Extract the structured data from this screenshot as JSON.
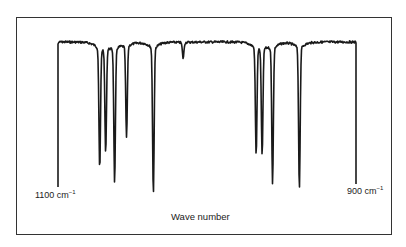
{
  "chart_data": {
    "type": "line",
    "title": "",
    "xlabel": "Wave number",
    "ylabel": "",
    "x_tick_labels": [
      {
        "value": 1100,
        "label": "1100 cm",
        "unit_exp": "-1"
      },
      {
        "value": 900,
        "label": "900 cm",
        "unit_exp": "-1"
      }
    ],
    "xlim": [
      1100,
      900
    ],
    "ylim": [
      0,
      100
    ],
    "grid": false,
    "legend": null,
    "series": [
      {
        "name": "IR transmittance spectrum",
        "baseline_transmittance": 95,
        "absorption_bands": [
          {
            "wavenumber": 1100,
            "transmittance": 0
          },
          {
            "wavenumber": 1072,
            "transmittance": 17
          },
          {
            "wavenumber": 1068,
            "transmittance": 28
          },
          {
            "wavenumber": 1062,
            "transmittance": 9
          },
          {
            "wavenumber": 1054,
            "transmittance": 36
          },
          {
            "wavenumber": 1036,
            "transmittance": 1
          },
          {
            "wavenumber": 1016,
            "transmittance": 85
          },
          {
            "wavenumber": 967,
            "transmittance": 26
          },
          {
            "wavenumber": 963,
            "transmittance": 26
          },
          {
            "wavenumber": 956,
            "transmittance": 8
          },
          {
            "wavenumber": 938,
            "transmittance": 4
          },
          {
            "wavenumber": 900,
            "transmittance": 2
          }
        ]
      }
    ]
  },
  "axis": {
    "xmin_label": "1100 cm",
    "xmax_label": "900 cm",
    "unit_exp": "−1",
    "xlabel": "Wave number"
  },
  "colors": {
    "trace": "#1a1a1a",
    "frame": "#333333"
  }
}
